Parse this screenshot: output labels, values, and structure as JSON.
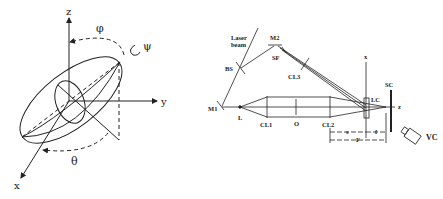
{
  "figure_left": {
    "title": "Ellipsoid orientation (Euler angles)",
    "axes": {
      "z": "z",
      "y": "y",
      "x": "x"
    },
    "angles": {
      "phi": "φ",
      "psi": "ψ",
      "theta": "θ"
    }
  },
  "figure_right": {
    "title": "Optical setup",
    "labels": {
      "laser_beam_1": "Laser",
      "laser_beam_2": "beam",
      "m2": "M2",
      "sf": "SF",
      "bs": "BS",
      "cl3": "CL3",
      "m1": "M1",
      "l": "L",
      "cl1": "CL1",
      "o": "O",
      "cl2": "CL2",
      "x_axis": "x",
      "lc": "LC",
      "sc": "SC",
      "z_axis": "z",
      "vc": "VC",
      "dim_s": "s",
      "dim_f_small": "f",
      "dim_F": "F"
    }
  },
  "colors": {
    "ink": "#222222",
    "background": "#ffffff"
  }
}
